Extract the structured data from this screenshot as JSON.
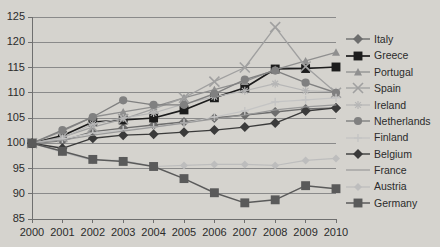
{
  "chart_data": {
    "type": "line",
    "title": "",
    "subtitle": "",
    "xlabel": "",
    "ylabel": "",
    "x": [
      2000,
      2001,
      2002,
      2003,
      2004,
      2005,
      2006,
      2007,
      2008,
      2009,
      2010
    ],
    "xtick_labels": [
      "2000",
      "2001",
      "2002",
      "2003",
      "2004",
      "2005",
      "2006",
      "2007",
      "2008",
      "2009",
      "2010"
    ],
    "ytick_labels": [
      "85",
      "90",
      "95",
      "100",
      "105",
      "110",
      "115",
      "120",
      "125"
    ],
    "ylim": [
      85,
      125
    ],
    "ytick_values": [
      85,
      90,
      95,
      100,
      105,
      110,
      115,
      120,
      125
    ],
    "grid": true,
    "grid_axis": "y",
    "legend_position": "right",
    "series": [
      {
        "name": "Italy",
        "color": "#6d6d6d",
        "marker": "diamond",
        "marker_size": 5,
        "line_width": 1.4,
        "values": [
          100,
          100.5,
          102.3,
          103.0,
          103.6,
          104.2,
          105.0,
          105.6,
          106.2,
          106.8,
          107.0
        ]
      },
      {
        "name": "Greece",
        "color": "#1c1c1c",
        "marker": "square",
        "marker_size": 6,
        "line_width": 1.7,
        "values": [
          100,
          101.5,
          104.2,
          104.6,
          105.0,
          106.6,
          109.0,
          111.0,
          114.7,
          114.8,
          115.1
        ]
      },
      {
        "name": "Portugal",
        "color": "#8f8f8f",
        "marker": "triangle",
        "marker_size": 4,
        "line_width": 1.3,
        "values": [
          100,
          102.4,
          105.2,
          106.2,
          107.2,
          109.0,
          110.6,
          112.2,
          114.6,
          116.3,
          118.0
        ]
      },
      {
        "name": "Spain",
        "color": "#a0a0a0",
        "marker": "x",
        "marker_size": 5,
        "line_width": 1.3,
        "values": [
          100,
          101.2,
          103.2,
          104.8,
          106.8,
          109.0,
          112.2,
          115.0,
          123.0,
          115.2,
          110.0
        ]
      },
      {
        "name": "Ireland",
        "color": "#b6b6b6",
        "marker": "star",
        "marker_size": 4,
        "line_width": 1.2,
        "values": [
          100,
          101.0,
          103.8,
          105.0,
          106.0,
          107.8,
          109.2,
          110.4,
          111.8,
          110.4,
          110.2
        ]
      },
      {
        "name": "Netherlands",
        "color": "#808080",
        "marker": "circle",
        "marker_size": 5,
        "line_width": 1.4,
        "values": [
          100,
          102.6,
          105.2,
          108.5,
          107.6,
          107.6,
          109.8,
          112.6,
          114.4,
          112.0,
          110.0
        ]
      },
      {
        "name": "Finland",
        "color": "#c4c4c4",
        "marker": "plus",
        "marker_size": 4,
        "line_width": 1.2,
        "values": [
          100,
          100.8,
          102.0,
          102.6,
          103.2,
          104.0,
          105.2,
          106.4,
          108.2,
          108.6,
          109.0
        ]
      },
      {
        "name": "Belgium",
        "color": "#3a3a3a",
        "marker": "diamond",
        "marker_size": 5,
        "line_width": 1.4,
        "values": [
          100,
          99.0,
          101.0,
          101.6,
          101.8,
          102.2,
          102.6,
          103.2,
          104.0,
          106.4,
          107.0
        ]
      },
      {
        "name": "France",
        "color": "#9a9a9a",
        "marker": "none",
        "marker_size": 0,
        "line_width": 1.2,
        "values": [
          100,
          100.6,
          101.6,
          102.4,
          103.2,
          104.0,
          104.8,
          105.6,
          106.6,
          107.2,
          107.6
        ]
      },
      {
        "name": "Austria",
        "color": "#bdbdbd",
        "marker": "diamond",
        "marker_size": 4,
        "line_width": 1.2,
        "values": [
          100,
          98.2,
          96.6,
          96.6,
          95.4,
          95.6,
          95.8,
          95.8,
          95.6,
          96.6,
          97.0
        ]
      },
      {
        "name": "Germany",
        "color": "#5a5a5a",
        "marker": "square",
        "marker_size": 6,
        "line_width": 1.5,
        "values": [
          100,
          98.4,
          96.8,
          96.4,
          95.4,
          93.0,
          90.2,
          88.2,
          88.8,
          91.6,
          91.0
        ]
      }
    ]
  },
  "axes": {
    "plot_left": 32,
    "plot_right": 336,
    "plot_top": 17,
    "plot_bottom": 219
  },
  "colors": {
    "background": "#d5d3ce",
    "grid": "#8a8a8a",
    "axis": "#6f6f6f",
    "text": "#2b2b2b"
  }
}
